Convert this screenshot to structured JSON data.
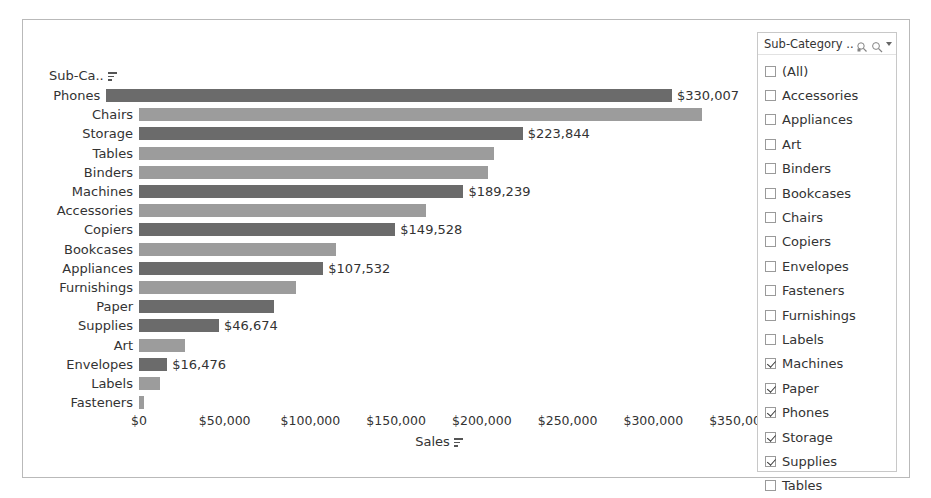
{
  "chart_data": {
    "type": "bar",
    "orientation": "horizontal",
    "title": "",
    "xlabel": "Sales",
    "ylabel": "Sub-Ca..",
    "xlim": [
      0,
      350000
    ],
    "xticks": [
      "$0",
      "$50,000",
      "$100,000",
      "$150,000",
      "$200,000",
      "$250,000",
      "$300,000",
      "$350,000"
    ],
    "xtick_values": [
      0,
      50000,
      100000,
      150000,
      200000,
      250000,
      300000,
      350000
    ],
    "grid": false,
    "legend": "none",
    "categories": [
      "Phones",
      "Chairs",
      "Storage",
      "Tables",
      "Binders",
      "Machines",
      "Accessories",
      "Copiers",
      "Bookcases",
      "Appliances",
      "Furnishings",
      "Paper",
      "Supplies",
      "Art",
      "Envelopes",
      "Labels",
      "Fasteners"
    ],
    "values": [
      330007,
      328449,
      223844,
      206966,
      203413,
      189239,
      167380,
      149528,
      114880,
      107532,
      91705,
      78479,
      46674,
      27119,
      16476,
      12486,
      3024
    ],
    "labels": [
      "$330,007",
      "",
      "$223,844",
      "",
      "",
      "$189,239",
      "",
      "$149,528",
      "",
      "$107,532",
      "",
      "",
      "$46,674",
      "",
      "$16,476",
      "",
      ""
    ],
    "selected": [
      true,
      false,
      true,
      false,
      false,
      true,
      false,
      true,
      false,
      true,
      false,
      true,
      true,
      false,
      true,
      false,
      false
    ],
    "bars": [
      {
        "category": "Phones",
        "value": 330007,
        "label": "$330,007",
        "selected": true
      },
      {
        "category": "Chairs",
        "value": 328449,
        "label": "",
        "selected": false
      },
      {
        "category": "Storage",
        "value": 223844,
        "label": "$223,844",
        "selected": true
      },
      {
        "category": "Tables",
        "value": 206966,
        "label": "",
        "selected": false
      },
      {
        "category": "Binders",
        "value": 203413,
        "label": "",
        "selected": false
      },
      {
        "category": "Machines",
        "value": 189239,
        "label": "$189,239",
        "selected": true
      },
      {
        "category": "Accessories",
        "value": 167380,
        "label": "",
        "selected": false
      },
      {
        "category": "Copiers",
        "value": 149528,
        "label": "$149,528",
        "selected": true
      },
      {
        "category": "Bookcases",
        "value": 114880,
        "label": "",
        "selected": false
      },
      {
        "category": "Appliances",
        "value": 107532,
        "label": "$107,532",
        "selected": true
      },
      {
        "category": "Furnishings",
        "value": 91705,
        "label": "",
        "selected": false
      },
      {
        "category": "Paper",
        "value": 78479,
        "label": "",
        "selected": true
      },
      {
        "category": "Supplies",
        "value": 46674,
        "label": "$46,674",
        "selected": true
      },
      {
        "category": "Art",
        "value": 27119,
        "label": "",
        "selected": false
      },
      {
        "category": "Envelopes",
        "value": 16476,
        "label": "$16,476",
        "selected": true
      },
      {
        "category": "Labels",
        "value": 12486,
        "label": "",
        "selected": false
      },
      {
        "category": "Fasteners",
        "value": 3024,
        "label": "",
        "selected": false
      }
    ],
    "colors": {
      "bar": "#9c9c9c",
      "bar_selected": "#6b6b6b",
      "text": "#333333"
    }
  },
  "axis": {
    "row_header": "Sub-Ca..",
    "x_title": "Sales"
  },
  "filter": {
    "title": "Sub-Category ...",
    "icons": [
      "crosshair-icon",
      "search-icon",
      "chevron-down-icon"
    ],
    "items": [
      {
        "label": "(All)",
        "checked": false
      },
      {
        "label": "Accessories",
        "checked": false
      },
      {
        "label": "Appliances",
        "checked": false
      },
      {
        "label": "Art",
        "checked": false
      },
      {
        "label": "Binders",
        "checked": false
      },
      {
        "label": "Bookcases",
        "checked": false
      },
      {
        "label": "Chairs",
        "checked": false
      },
      {
        "label": "Copiers",
        "checked": false
      },
      {
        "label": "Envelopes",
        "checked": false
      },
      {
        "label": "Fasteners",
        "checked": false
      },
      {
        "label": "Furnishings",
        "checked": false
      },
      {
        "label": "Labels",
        "checked": false
      },
      {
        "label": "Machines",
        "checked": true
      },
      {
        "label": "Paper",
        "checked": true
      },
      {
        "label": "Phones",
        "checked": true
      },
      {
        "label": "Storage",
        "checked": true
      },
      {
        "label": "Supplies",
        "checked": true
      },
      {
        "label": "Tables",
        "checked": false
      }
    ]
  }
}
